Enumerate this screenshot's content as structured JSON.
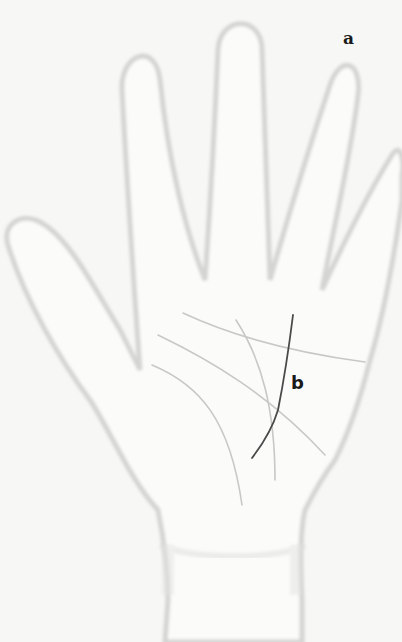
{
  "figure": {
    "labels": {
      "a": "a",
      "b": "b"
    },
    "colors": {
      "background": "#f7f7f5",
      "hand_outline": "#d4d4d2",
      "hand_fill": "#fbfbfa",
      "faint_lines": "#c8c8c6",
      "highlighted_line": "#4a4a4a",
      "label_text": "#1a1a1a"
    }
  }
}
